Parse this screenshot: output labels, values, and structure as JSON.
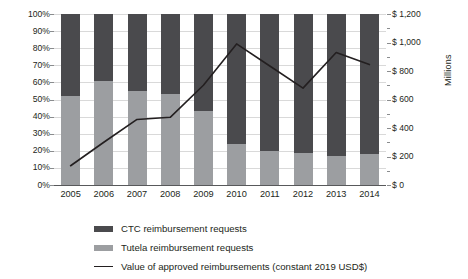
{
  "chart_data": {
    "type": "bar",
    "title": "",
    "subtitle": "",
    "xlabel": "",
    "ylabel": "",
    "y2label": "Millions",
    "grid": true,
    "legend_position": "bottom-left",
    "categories": [
      "2005",
      "2006",
      "2007",
      "2008",
      "2009",
      "2010",
      "2011",
      "2012",
      "2013",
      "2014"
    ],
    "stacked": true,
    "stack_total_percent": 100,
    "ylim": [
      0,
      100
    ],
    "ytick_labels": [
      "0%",
      "10%",
      "20%",
      "30%",
      "40%",
      "50%",
      "60%",
      "70%",
      "80%",
      "90%",
      "100%"
    ],
    "ytick_values": [
      0,
      10,
      20,
      30,
      40,
      50,
      60,
      70,
      80,
      90,
      100
    ],
    "y2lim": [
      0,
      1200
    ],
    "y2tick_labels": [
      "$ 0",
      "$ 200",
      "$ 400",
      "$ 600",
      "$ 800",
      "$ 1,000",
      "$ 1,200"
    ],
    "y2tick_values": [
      0,
      200,
      400,
      600,
      800,
      1000,
      1200
    ],
    "series": [
      {
        "name": "Tutela reimbursement requests",
        "type": "bar",
        "color": "#9c9ea1",
        "axis": "left",
        "unit": "%",
        "values": [
          52,
          61,
          55,
          53,
          43,
          24,
          20,
          19,
          17,
          18
        ]
      },
      {
        "name": "CTC reimbursement requests",
        "type": "bar",
        "color": "#4a4a4d",
        "axis": "left",
        "unit": "%",
        "values": [
          48,
          39,
          45,
          47,
          57,
          76,
          80,
          81,
          83,
          82
        ]
      },
      {
        "name": "Value of approved reimbursements (constant 2019 USD$)",
        "type": "line",
        "color": "#231f20",
        "axis": "right",
        "unit": "millions USD",
        "values": [
          135,
          300,
          460,
          475,
          700,
          990,
          835,
          680,
          930,
          845
        ]
      }
    ]
  },
  "legend": {
    "items": [
      {
        "label": "CTC reimbursement requests",
        "marker": "square-dark"
      },
      {
        "label": "Tutela reimbursement requests",
        "marker": "square-light"
      },
      {
        "label": "Value of approved reimbursements (constant 2019 USD$)",
        "marker": "line"
      }
    ]
  },
  "axes": {
    "right_title": "Millions"
  }
}
